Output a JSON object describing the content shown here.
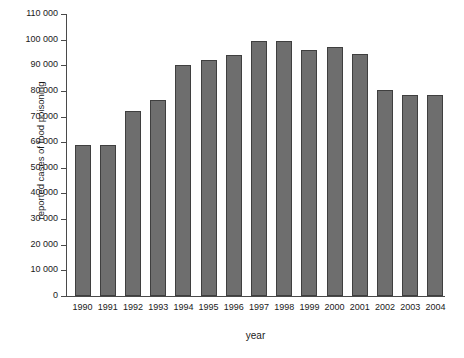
{
  "chart_data": {
    "type": "bar",
    "title": "",
    "xlabel": "year",
    "ylabel": "reported cases of food poisoning",
    "categories": [
      "1990",
      "1991",
      "1992",
      "1993",
      "1994",
      "1995",
      "1996",
      "1997",
      "1998",
      "1999",
      "2000",
      "2001",
      "2002",
      "2003",
      "2004"
    ],
    "values": [
      59000,
      59000,
      72000,
      76500,
      90000,
      92000,
      94000,
      99500,
      99500,
      96000,
      97000,
      94500,
      80500,
      78500,
      78500
    ],
    "ylim": [
      0,
      110000
    ],
    "ytick_labels": [
      "0",
      "10 000",
      "20 000",
      "30 000",
      "40 000",
      "50 000",
      "60 000",
      "70 000",
      "80 000",
      "90 000",
      "100 000",
      "110 000"
    ],
    "ytick_values": [
      0,
      10000,
      20000,
      30000,
      40000,
      50000,
      60000,
      70000,
      80000,
      90000,
      100000,
      110000
    ],
    "grid": false,
    "legend": null,
    "bar_color": "#6e6e6e",
    "bar_edge_color": "#3f3f3f",
    "axis_color": "#4a4a4a"
  }
}
